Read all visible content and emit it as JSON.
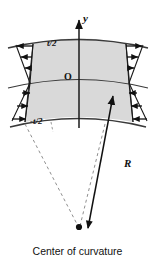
{
  "figure": {
    "background": "#ffffff",
    "width": 155,
    "height": 268
  },
  "labels": {
    "y_axis": "y",
    "top_fiber": "t/2",
    "origin": "O",
    "bottom_fiber": "-t/2",
    "radius": "R",
    "center": "Center of curvature"
  },
  "colors": {
    "section_fill": "#d9d9d9",
    "section_stroke": "#3a3a3a",
    "arrow": "#111111",
    "dashed_line": "#8f8f8f",
    "axis": "#1a1a1a",
    "text": "#111111"
  },
  "geometry": {
    "center_of_curvature": {
      "x": 79,
      "y": 228
    },
    "neutral_axis_y": 79,
    "top_fiber_y": 41,
    "bottom_fiber_y": 123,
    "y_axis_x": 79,
    "radius_label_anchor": {
      "x": 124,
      "y": 158
    }
  },
  "stress_arrows": {
    "description": "Linear-through-depth stress arrows on both cut faces; tension above neutral axis, compression below, magnitude zero at the neutral axis.",
    "left_face": [
      {
        "y": 45,
        "length": 20,
        "direction": "left"
      },
      {
        "y": 56,
        "length": 14,
        "direction": "left"
      },
      {
        "y": 67,
        "length": 8,
        "direction": "left"
      },
      {
        "y": 92,
        "length": 9,
        "direction": "right"
      },
      {
        "y": 105,
        "length": 15,
        "direction": "right"
      },
      {
        "y": 118,
        "length": 21,
        "direction": "right"
      }
    ],
    "right_face": [
      {
        "y": 45,
        "length": 20,
        "direction": "right"
      },
      {
        "y": 56,
        "length": 14,
        "direction": "right"
      },
      {
        "y": 67,
        "length": 8,
        "direction": "right"
      },
      {
        "y": 92,
        "length": 9,
        "direction": "left"
      },
      {
        "y": 105,
        "length": 15,
        "direction": "left"
      },
      {
        "y": 118,
        "length": 21,
        "direction": "left"
      }
    ]
  },
  "elements": {
    "y_axis_arrow": "upward vertical arrow through the section centroid",
    "radius_arrow": "solid double-headed arrow from center of curvature to outer fiber",
    "radial_dashed_lines": "two dashed lines from the section side faces converging at the center of curvature"
  }
}
